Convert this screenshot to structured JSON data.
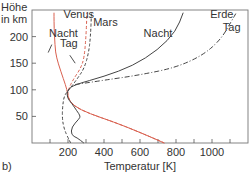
{
  "chart_data": {
    "type": "line",
    "panel_label": "b)",
    "title": "",
    "xlabel": "Temperatur [K]",
    "ylabel": "Höhe in km",
    "ylabel_lines": [
      "Höhe",
      "in km"
    ],
    "xlim": [
      0,
      1200
    ],
    "ylim": [
      0,
      250
    ],
    "xticks": [
      200,
      400,
      600,
      800,
      1000
    ],
    "xtick_minor": [
      100,
      300,
      500,
      700,
      900,
      1100
    ],
    "yticks": [
      50,
      100,
      150,
      200
    ],
    "grid": false,
    "series": [
      {
        "name": "Venus Nacht",
        "planet": "Venus",
        "condition": "Nacht",
        "color": "#d9604f",
        "style": "solid",
        "points": [
          [
            735,
            0
          ],
          [
            600,
            20
          ],
          [
            450,
            40
          ],
          [
            320,
            55
          ],
          [
            230,
            70
          ],
          [
            200,
            85
          ],
          [
            195,
            100
          ],
          [
            175,
            120
          ],
          [
            145,
            150
          ],
          [
            130,
            170
          ],
          [
            125,
            200
          ],
          [
            122,
            230
          ],
          [
            122,
            245
          ]
        ]
      },
      {
        "name": "Venus Tag",
        "planet": "Venus",
        "condition": "Tag",
        "color": "#d9604f",
        "style": "dashed",
        "points": [
          [
            735,
            0
          ],
          [
            600,
            20
          ],
          [
            450,
            40
          ],
          [
            320,
            55
          ],
          [
            230,
            70
          ],
          [
            200,
            85
          ],
          [
            200,
            100
          ],
          [
            230,
            120
          ],
          [
            270,
            140
          ],
          [
            290,
            160
          ],
          [
            300,
            200
          ],
          [
            305,
            245
          ]
        ]
      },
      {
        "name": "Mars",
        "planet": "Mars",
        "condition": "",
        "color": "#444444",
        "style": "dashed",
        "points": [
          [
            215,
            0
          ],
          [
            200,
            10
          ],
          [
            180,
            25
          ],
          [
            168,
            45
          ],
          [
            170,
            70
          ],
          [
            180,
            90
          ],
          [
            205,
            100
          ],
          [
            250,
            120
          ],
          [
            290,
            140
          ],
          [
            315,
            170
          ],
          [
            325,
            200
          ],
          [
            330,
            245
          ]
        ]
      },
      {
        "name": "Erde Nacht",
        "planet": "Erde",
        "condition": "Nacht",
        "color": "#444444",
        "style": "solid",
        "points": [
          [
            288,
            0
          ],
          [
            250,
            10
          ],
          [
            218,
            15
          ],
          [
            220,
            30
          ],
          [
            260,
            45
          ],
          [
            270,
            50
          ],
          [
            250,
            60
          ],
          [
            220,
            75
          ],
          [
            195,
            85
          ],
          [
            195,
            100
          ],
          [
            240,
            110
          ],
          [
            400,
            125
          ],
          [
            560,
            145
          ],
          [
            700,
            175
          ],
          [
            800,
            210
          ],
          [
            840,
            245
          ]
        ]
      },
      {
        "name": "Erde Tag",
        "planet": "Erde",
        "condition": "Tag",
        "color": "#444444",
        "style": "dashdot",
        "points": [
          [
            240,
            110
          ],
          [
            400,
            118
          ],
          [
            600,
            128
          ],
          [
            800,
            142
          ],
          [
            950,
            165
          ],
          [
            1050,
            195
          ],
          [
            1110,
            230
          ],
          [
            1135,
            245
          ]
        ]
      }
    ],
    "annotations": [
      {
        "text": "Venus",
        "x": 175,
        "y": 235
      },
      {
        "text": "Mars",
        "x": 340,
        "y": 220
      },
      {
        "text": "Nacht",
        "x": 95,
        "y": 200
      },
      {
        "text": "Tag",
        "x": 155,
        "y": 180
      },
      {
        "text": "Nacht",
        "x": 620,
        "y": 200
      },
      {
        "text": "Erde",
        "x": 990,
        "y": 235
      },
      {
        "text": "Tag",
        "x": 1060,
        "y": 210
      }
    ]
  }
}
